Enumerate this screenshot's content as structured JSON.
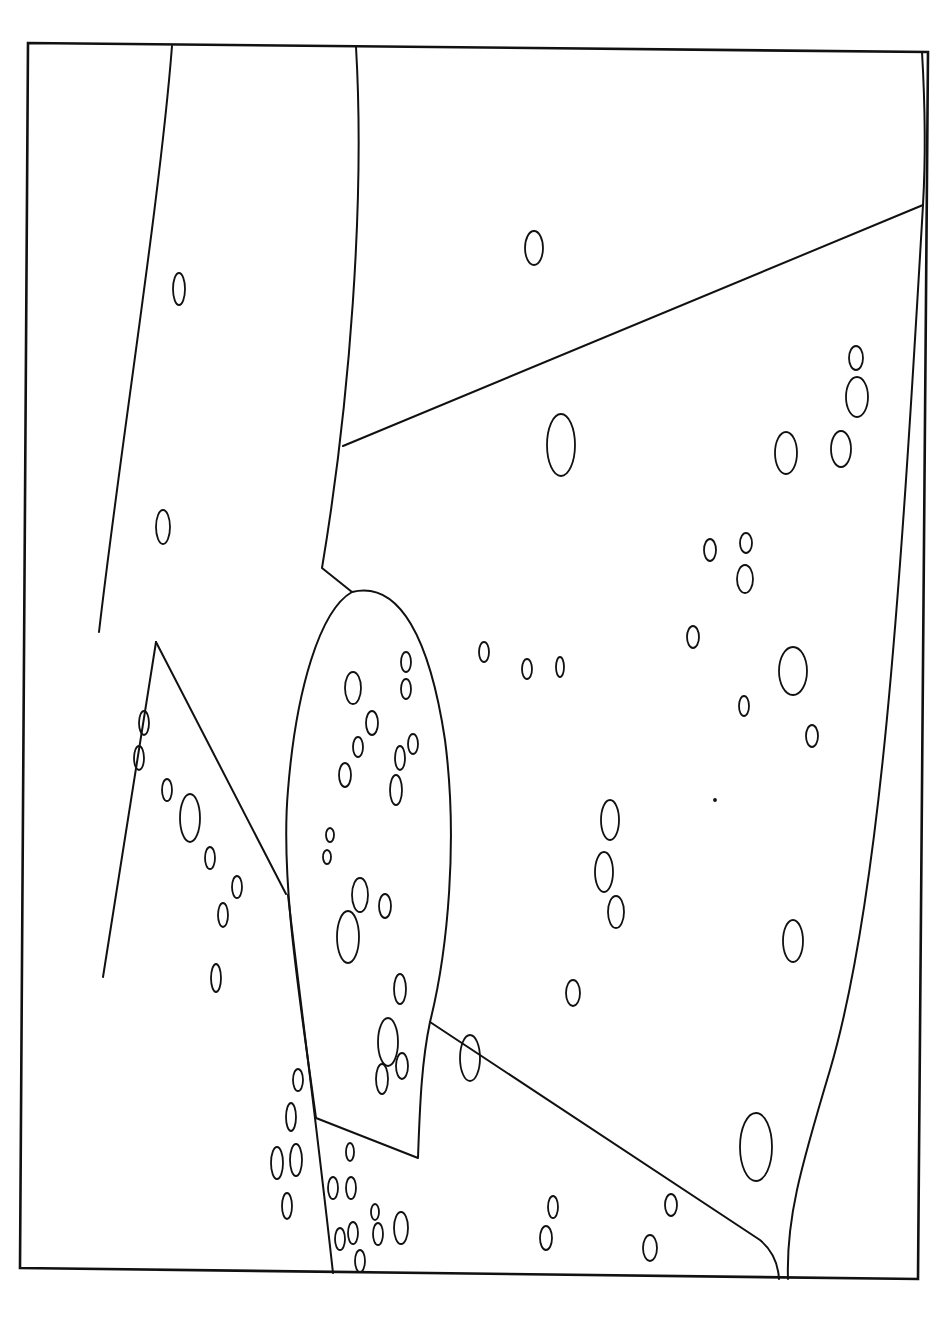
{
  "figure": {
    "background": "#ffffff",
    "stroke_color": "#111111",
    "frame": {
      "points": [
        [
          28,
          43
        ],
        [
          928,
          52
        ],
        [
          918,
          1279
        ],
        [
          20,
          1268
        ]
      ]
    },
    "regions": [
      {
        "name": "left-band-left-edge",
        "d": "M172,46 C160,200 120,450 99,632"
      },
      {
        "name": "left-band-right-edge",
        "d": "M356,47 C365,200 350,400 322,568 L352,592"
      },
      {
        "name": "upper-diagonal",
        "d": "M343,446 L923,205"
      },
      {
        "name": "right-thin-sliver",
        "d": "M922,52 C926,120 925,170 923,205"
      },
      {
        "name": "right-long-curve",
        "d": "M923,205 C900,600 880,900 830,1070 C800,1170 786,1220 788,1279"
      },
      {
        "name": "central-blob",
        "d": "M352,592 C400,580 430,640 445,740 C458,840 448,950 430,1022 C422,1060 420,1100 418,1158 L316,1118 C300,1000 280,880 288,790 C296,690 320,610 352,592 Z"
      },
      {
        "name": "lower-diagonal",
        "d": "M430,1022 L760,1240 C772,1250 778,1262 779,1279"
      },
      {
        "name": "triangle-left",
        "d": "M156,642 L103,977"
      },
      {
        "name": "triangle-right",
        "d": "M156,642 L286,894"
      },
      {
        "name": "lower-left-boundary",
        "d": "M288,895 C300,1000 315,1110 333,1273"
      }
    ],
    "ellipses": [
      [
        179,
        289,
        6,
        16
      ],
      [
        163,
        527,
        7,
        17
      ],
      [
        534,
        248,
        9,
        17
      ],
      [
        856,
        358,
        7,
        12
      ],
      [
        857,
        397,
        11,
        20
      ],
      [
        786,
        453,
        11,
        21
      ],
      [
        841,
        449,
        10,
        18
      ],
      [
        561,
        445,
        14,
        31
      ],
      [
        710,
        550,
        6,
        11
      ],
      [
        746,
        543,
        6,
        10
      ],
      [
        745,
        579,
        8,
        14
      ],
      [
        693,
        637,
        6,
        11
      ],
      [
        793,
        671,
        14,
        24
      ],
      [
        744,
        706,
        5,
        10
      ],
      [
        812,
        736,
        6,
        11
      ],
      [
        484,
        652,
        5,
        10
      ],
      [
        527,
        669,
        5,
        10
      ],
      [
        560,
        667,
        4,
        10
      ],
      [
        406,
        662,
        5,
        10
      ],
      [
        406,
        689,
        5,
        10
      ],
      [
        353,
        688,
        8,
        16
      ],
      [
        372,
        723,
        6,
        12
      ],
      [
        358,
        747,
        5,
        10
      ],
      [
        413,
        744,
        5,
        10
      ],
      [
        400,
        758,
        5,
        12
      ],
      [
        345,
        775,
        6,
        12
      ],
      [
        396,
        790,
        6,
        15
      ],
      [
        330,
        835,
        4,
        7
      ],
      [
        327,
        857,
        4,
        7
      ],
      [
        360,
        895,
        8,
        17
      ],
      [
        385,
        906,
        6,
        12
      ],
      [
        348,
        937,
        11,
        26
      ],
      [
        400,
        989,
        6,
        15
      ],
      [
        388,
        1042,
        10,
        24
      ],
      [
        402,
        1066,
        6,
        13
      ],
      [
        382,
        1079,
        6,
        15
      ],
      [
        610,
        820,
        9,
        20
      ],
      [
        604,
        872,
        9,
        20
      ],
      [
        616,
        912,
        8,
        16
      ],
      [
        793,
        941,
        10,
        21
      ],
      [
        573,
        993,
        7,
        13
      ],
      [
        470,
        1058,
        10,
        23
      ],
      [
        756,
        1147,
        16,
        34
      ],
      [
        144,
        723,
        5,
        12
      ],
      [
        139,
        758,
        5,
        12
      ],
      [
        167,
        790,
        5,
        11
      ],
      [
        190,
        818,
        10,
        24
      ],
      [
        210,
        858,
        5,
        11
      ],
      [
        237,
        887,
        5,
        11
      ],
      [
        223,
        915,
        5,
        12
      ],
      [
        216,
        978,
        5,
        14
      ],
      [
        298,
        1080,
        5,
        11
      ],
      [
        291,
        1117,
        5,
        14
      ],
      [
        277,
        1163,
        6,
        16
      ],
      [
        296,
        1160,
        6,
        16
      ],
      [
        287,
        1206,
        5,
        13
      ],
      [
        350,
        1152,
        4,
        9
      ],
      [
        333,
        1188,
        5,
        11
      ],
      [
        351,
        1188,
        5,
        11
      ],
      [
        340,
        1239,
        5,
        11
      ],
      [
        353,
        1233,
        5,
        11
      ],
      [
        375,
        1212,
        4,
        8
      ],
      [
        378,
        1234,
        5,
        11
      ],
      [
        401,
        1228,
        7,
        16
      ],
      [
        360,
        1261,
        5,
        11
      ],
      [
        553,
        1207,
        5,
        11
      ],
      [
        546,
        1238,
        6,
        12
      ],
      [
        671,
        1205,
        6,
        11
      ],
      [
        650,
        1248,
        7,
        13
      ],
      [
        715,
        800,
        1,
        1
      ]
    ]
  }
}
